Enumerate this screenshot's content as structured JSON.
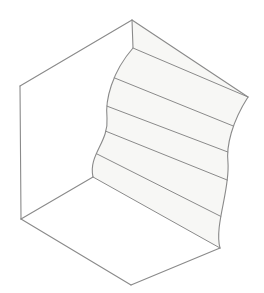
{
  "figure": {
    "view": "isometric / axonometric",
    "style": "white line drawing, no labels, no axes, no text"
  },
  "colors": {
    "background": "#ffffff",
    "outline": "#8a8a8a",
    "rule_line": "#8a8a8a",
    "swept_face_fill": "#f7f7f5",
    "flat_face_fill": "#ffffff"
  },
  "canvas": {
    "width": 264,
    "height": 293
  },
  "geometry": {
    "vertices": {
      "top_apex": [
        132,
        20
      ],
      "left_top_corner": [
        20,
        86
      ],
      "left_bottom_corner": [
        21,
        219
      ],
      "bottom_apex": [
        131,
        285
      ],
      "sweep_top_front": [
        133,
        48
      ],
      "sweep_bottom_front": [
        93,
        177
      ],
      "right_top_corner": [
        248,
        97
      ],
      "right_bottom_corner": [
        220,
        248
      ]
    },
    "front_profile_curve": {
      "description": "S-shaped ogee profile on the near vertical edge of the swept surface",
      "start": [
        133,
        48
      ],
      "control_1": [
        112,
        72
      ],
      "control_2": [
        105,
        100
      ],
      "mid": [
        107,
        118
      ],
      "control_3": [
        109,
        142
      ],
      "control_4": [
        88,
        155
      ],
      "end": [
        93,
        177
      ]
    },
    "back_profile_curve": {
      "description": "S-shaped ogee profile on the far vertical edge of the swept surface",
      "start": [
        248,
        97
      ],
      "control_1": [
        232,
        122
      ],
      "control_2": [
        226,
        146
      ],
      "mid": [
        228,
        163
      ],
      "control_3": [
        230,
        190
      ],
      "control_4": [
        214,
        226
      ],
      "end": [
        220,
        248
      ]
    },
    "sweep_direction": [
      115,
      72
    ],
    "rule_line_count": 5,
    "rule_line_t_values": [
      0.0,
      0.2,
      0.4,
      0.6,
      0.8,
      1.0
    ]
  },
  "faces": [
    {
      "name": "left-flat-face",
      "shading": "white",
      "corners": [
        "top_apex",
        "left_top_corner",
        "left_bottom_corner",
        "sweep_bottom_front",
        "sweep_top_front"
      ]
    },
    {
      "name": "bottom-flat-face",
      "shading": "white",
      "corners": [
        "left_bottom_corner",
        "bottom_apex",
        "right_bottom_corner",
        "sweep_bottom_front"
      ]
    },
    {
      "name": "swept-ogee-face",
      "shading": "light gray",
      "corners": [
        "top_apex",
        "right_top_corner",
        "right_bottom_corner",
        "sweep_bottom_front",
        "sweep_top_front"
      ]
    }
  ],
  "annotations": {
    "text_labels": [],
    "dimensions": [],
    "legend": []
  }
}
